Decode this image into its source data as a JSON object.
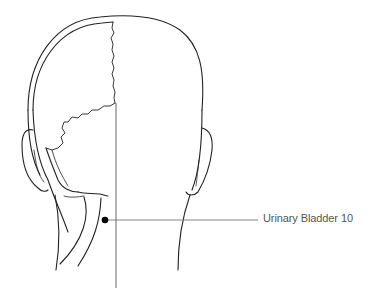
{
  "diagram": {
    "point": {
      "label": "Urinary Bladder 10",
      "marker_color": "#000000",
      "leader_color": "#777777"
    },
    "stroke_color": "#222222",
    "background": "#ffffff"
  }
}
